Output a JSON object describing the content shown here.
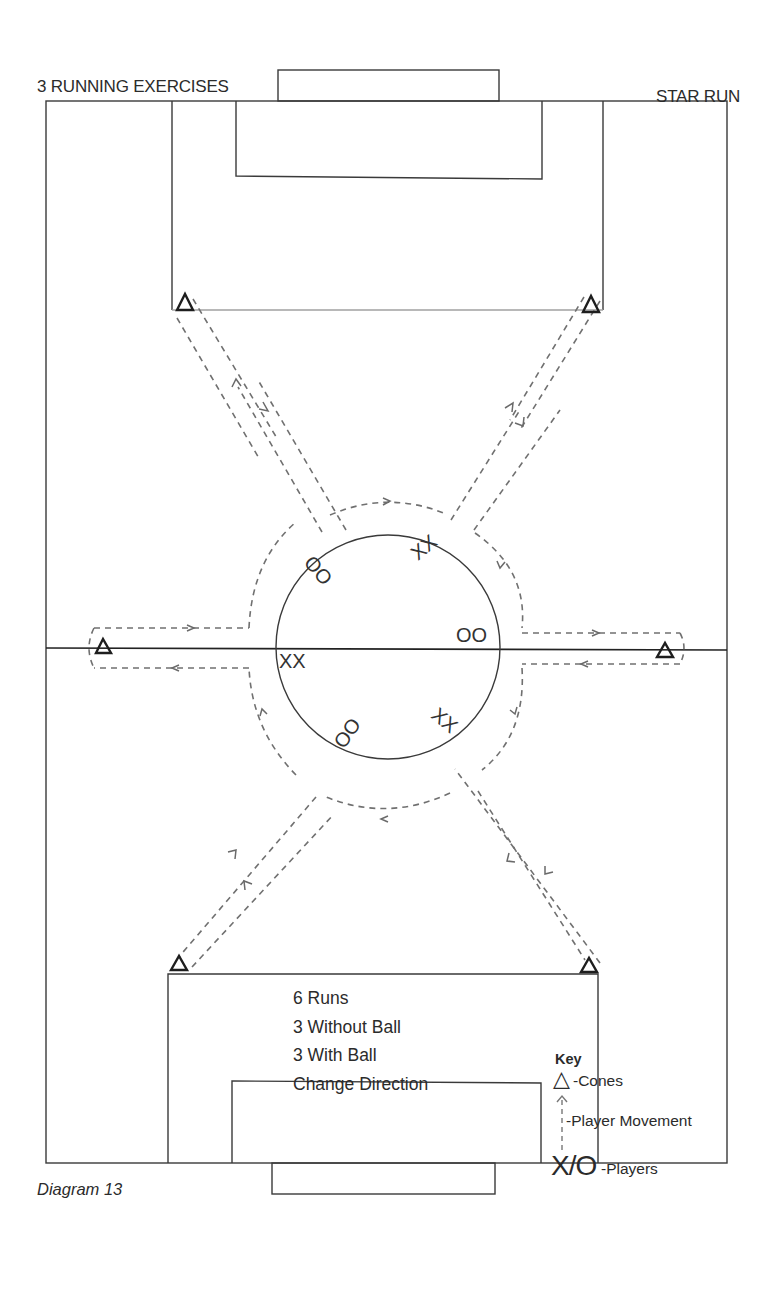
{
  "header": {
    "title_left": "3 RUNNING EXERCISES",
    "title_right": "STAR RUN"
  },
  "notes": {
    "lines": [
      "6 Runs",
      "3 Without Ball",
      "3 With Ball",
      "Change Direction"
    ]
  },
  "key": {
    "title": "Key",
    "cone_symbol": "△",
    "cones_label": "-Cones",
    "movement_symbol": "dashed-arrow-up",
    "movement_label": "-Player Movement",
    "players_symbol": "X/O",
    "players_label": "-Players"
  },
  "caption": "Diagram 13",
  "players": [
    {
      "label": "OO",
      "position": "upper-left-inside-circle"
    },
    {
      "label": "XX",
      "position": "top-inside-circle"
    },
    {
      "label": "OO",
      "position": "right-inside-circle"
    },
    {
      "label": "XX",
      "position": "left-inside-circle"
    },
    {
      "label": "OO",
      "position": "lower-left-inside-circle"
    },
    {
      "label": "XX",
      "position": "lower-right-inside-circle"
    }
  ],
  "cones": [
    {
      "id": "top-left",
      "symbol": "△"
    },
    {
      "id": "top-right",
      "symbol": "△"
    },
    {
      "id": "mid-left",
      "symbol": "△"
    },
    {
      "id": "mid-right",
      "symbol": "△"
    },
    {
      "id": "bottom-left",
      "symbol": "△"
    },
    {
      "id": "bottom-right",
      "symbol": "△"
    }
  ],
  "colors": {
    "line": "#2e2e2e",
    "light_line": "#9a9a9a",
    "dash": "#6e6e6e",
    "background": "#ffffff"
  }
}
